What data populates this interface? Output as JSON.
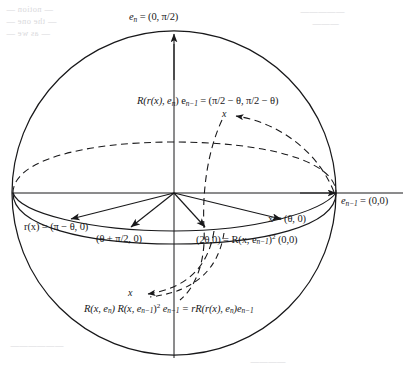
{
  "figure": {
    "type": "geometric-diagram",
    "canvas": {
      "width": 411,
      "height": 379
    },
    "sphere": {
      "cx": 174,
      "cy": 193,
      "r": 162,
      "stroke": "#18181a"
    },
    "colors": {
      "ink": "#18181a",
      "background": "#ffffff",
      "bleed_through": "#d9d9dc"
    }
  },
  "labels": {
    "top_axis": "e",
    "top_axis_sub": "n",
    "top_axis_value": " = (0, π/2)",
    "right_axis": "e",
    "right_axis_sub": "n−1",
    "right_axis_value": " = (0,0)",
    "upper_right_eq_lhs_r": "R",
    "upper_right_eq": "R(r(x), e",
    "upper_right_eq_sub": "n",
    "upper_right_eq_mid": ") e",
    "upper_right_eq_sub2": "n−1",
    "upper_right_eq_rhs": " = (π/2 − θ, π/2 − θ)",
    "left_arrow_label": "r(x) = (π − θ, 0)",
    "mid_left_arrow_label": "(θ + π/2, 0)",
    "mid_right_arrow_label_a": "(2θ,0) = R(x, e",
    "mid_right_arrow_label_sub": "n−1",
    "mid_right_arrow_label_b": ")",
    "mid_right_arrow_label_sup": "2",
    "mid_right_arrow_label_c": " (0,0)",
    "right_arrow_label": "x = (θ, 0)",
    "bottom_eq_a": "R(x, e",
    "bottom_eq_sub1": "n",
    "bottom_eq_b": ") R(x, e",
    "bottom_eq_sub2": "n−1",
    "bottom_eq_c": ")",
    "bottom_eq_sup": "2",
    "bottom_eq_d": " e",
    "bottom_eq_sub3": "n−1",
    "bottom_eq_e": " = rR(r(x), e",
    "bottom_eq_sub4": "n",
    "bottom_eq_f": ")e",
    "bottom_eq_sub5": "n−1",
    "marker_x_upper": "x",
    "marker_x_lower": "x"
  },
  "bleed_text": {
    "l1": "— notion  —",
    "l2": "— the one —",
    "l3": "— as we —",
    "r1": "—————",
    "r2": "———",
    "b1": "——————",
    "b2": "————"
  }
}
